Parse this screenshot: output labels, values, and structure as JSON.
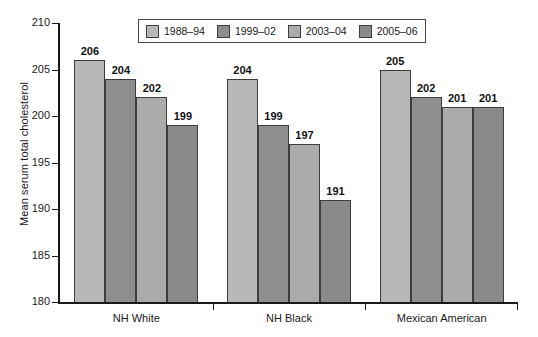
{
  "chart_data": {
    "type": "bar",
    "title": "",
    "subtitle": "",
    "xlabel": "",
    "ylabel": "Mean serum total cholesterol",
    "ylim": [
      180,
      210
    ],
    "ytick_labels": [
      "180",
      "185",
      "190",
      "195",
      "200",
      "205",
      "210"
    ],
    "ytick_values": [
      180,
      185,
      190,
      195,
      200,
      205,
      210
    ],
    "grid": false,
    "legend_position": "top-center",
    "categories": [
      "NH White",
      "NH Black",
      "Mexican American"
    ],
    "series": [
      {
        "name": "1988–94",
        "color": "#b8b8b8",
        "values": [
          206,
          204,
          205
        ]
      },
      {
        "name": "1999–02",
        "color": "#8e8e8e",
        "values": [
          204,
          199,
          202
        ]
      },
      {
        "name": "2003–04",
        "color": "#ababab",
        "values": [
          202,
          197,
          201
        ]
      },
      {
        "name": "2005–06",
        "color": "#8a8a8a",
        "values": [
          199,
          191,
          201
        ]
      }
    ],
    "bar_labels": [
      [
        "206",
        "204",
        "202",
        "199"
      ],
      [
        "204",
        "199",
        "197",
        "191"
      ],
      [
        "205",
        "202",
        "201",
        "201"
      ]
    ]
  },
  "legend": {
    "items": [
      {
        "label": "1988–94"
      },
      {
        "label": "1999–02"
      },
      {
        "label": "2003–04"
      },
      {
        "label": "2005–06"
      }
    ]
  },
  "axes": {
    "y_title": "Mean serum total cholesterol",
    "y_ticks": [
      {
        "label": "210"
      },
      {
        "label": "205"
      },
      {
        "label": "200"
      },
      {
        "label": "195"
      },
      {
        "label": "190"
      },
      {
        "label": "185"
      },
      {
        "label": "180"
      }
    ],
    "x_groups": [
      {
        "label": "NH White"
      },
      {
        "label": "NH Black"
      },
      {
        "label": "Mexican American"
      }
    ]
  }
}
